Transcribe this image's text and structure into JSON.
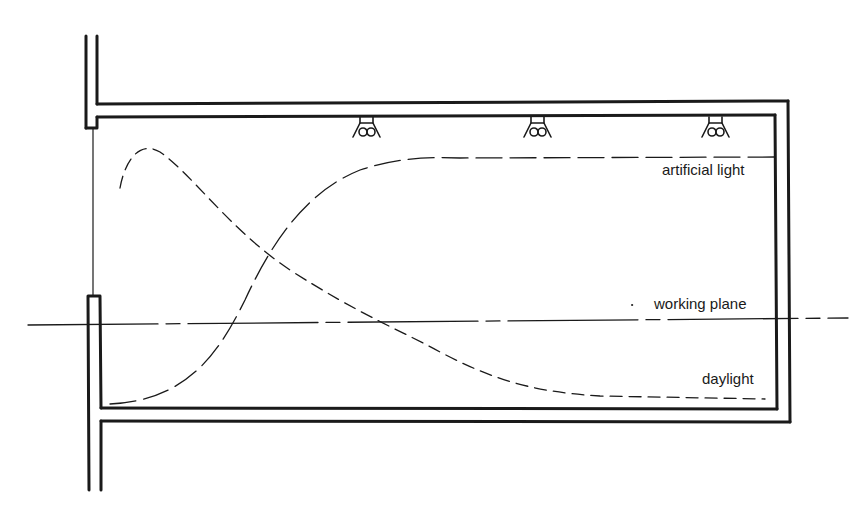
{
  "diagram": {
    "type": "section",
    "labels": {
      "artificial_light": "artificial light",
      "working_plane": "working plane",
      "daylight": "daylight"
    },
    "luminaires": [
      {
        "name": "luminaire-1",
        "x": 367
      },
      {
        "name": "luminaire-2",
        "x": 538
      },
      {
        "name": "luminaire-3",
        "x": 716
      }
    ],
    "colors": {
      "ink": "#1a1a1a",
      "background": "#ffffff"
    }
  }
}
